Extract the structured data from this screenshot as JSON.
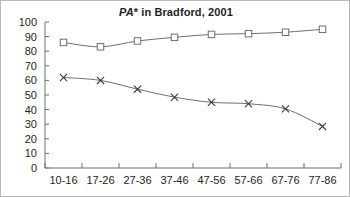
{
  "chart_data": {
    "type": "line",
    "title": "PA* in Bradford, 2001",
    "title_italic_part": "PA",
    "title_rest_part": "* in Bradford, 2001",
    "xlabel": "",
    "ylabel": "",
    "categories": [
      "10-16",
      "17-26",
      "27-36",
      "37-46",
      "47-56",
      "57-66",
      "67-76",
      "77-86"
    ],
    "ylim": [
      0,
      100
    ],
    "y_ticks": [
      0,
      10,
      20,
      30,
      40,
      50,
      60,
      70,
      80,
      90,
      100
    ],
    "grid": false,
    "legend": "none",
    "series": [
      {
        "name": "upper-series",
        "marker": "open-square",
        "values": [
          86,
          83,
          87,
          89.5,
          91.5,
          92,
          93,
          95
        ]
      },
      {
        "name": "lower-series",
        "marker": "cross",
        "values": [
          62,
          60,
          54,
          48.5,
          45,
          44,
          40.5,
          28.5
        ]
      }
    ]
  },
  "figure": {
    "axis_color": "#6e6e6e",
    "text_color": "#231f20",
    "background": "#ffffff",
    "border_color": "#b9b9b9"
  }
}
